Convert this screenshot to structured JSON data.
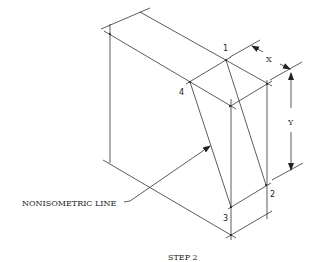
{
  "figure": {
    "caption": "STEP 2",
    "callout": "NONISOMETRIC LINE",
    "points": [
      {
        "label": "1"
      },
      {
        "label": "2"
      },
      {
        "label": "3"
      },
      {
        "label": "4"
      }
    ],
    "dimensions": {
      "x_label": "X",
      "y_label": "Y"
    },
    "colors": {
      "line": "#333333",
      "background": "#ffffff"
    }
  }
}
